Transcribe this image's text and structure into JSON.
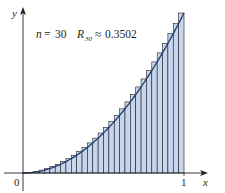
{
  "chart_data": {
    "type": "bar",
    "subtype": "riemann-sum-right-endpoints",
    "title": "",
    "annotation": {
      "n_label": "n",
      "n_value": "30",
      "r_label": "R",
      "r_subscript": "30",
      "approx": "≈",
      "r_value": "0.3502",
      "text": "n = 30   R30 ≈ 0.3502"
    },
    "function": "y = x^2",
    "n": 30,
    "interval": [
      0,
      1
    ],
    "xlabel": "x",
    "ylabel": "y",
    "x_ticks": [
      "0",
      "1"
    ],
    "xlim": [
      0,
      1
    ],
    "ylim": [
      0,
      1
    ],
    "grid": false,
    "legend": null,
    "categories": [
      "1/30",
      "2/30",
      "3/30",
      "4/30",
      "5/30",
      "6/30",
      "7/30",
      "8/30",
      "9/30",
      "10/30",
      "11/30",
      "12/30",
      "13/30",
      "14/30",
      "15/30",
      "16/30",
      "17/30",
      "18/30",
      "19/30",
      "20/30",
      "21/30",
      "22/30",
      "23/30",
      "24/30",
      "25/30",
      "26/30",
      "27/30",
      "28/30",
      "29/30",
      "30/30"
    ],
    "values": [
      0.0011,
      0.0044,
      0.01,
      0.0178,
      0.0278,
      0.04,
      0.0544,
      0.0711,
      0.09,
      0.1111,
      0.1344,
      0.16,
      0.1878,
      0.2178,
      0.25,
      0.2844,
      0.3211,
      0.36,
      0.4011,
      0.4444,
      0.49,
      0.5378,
      0.5878,
      0.64,
      0.6944,
      0.7511,
      0.81,
      0.8711,
      0.9344,
      1.0
    ],
    "colors": {
      "bar_fill": "#c6d6ef",
      "bar_stroke": "#231f20",
      "curve": "#1f3a6b",
      "axis": "#231f20"
    }
  }
}
